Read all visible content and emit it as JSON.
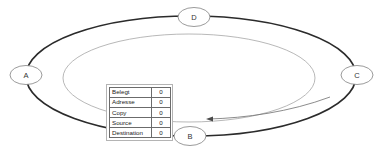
{
  "diagram": {
    "type": "ring-network-diagram",
    "background_color": "#ffffff",
    "outer_ring_color": "#2b2b2b",
    "inner_ring_color": "#9a9a9a",
    "node_stroke_color": "#808080",
    "arrow_color": "#6e6e6e",
    "nodes": [
      {
        "id": "A",
        "label": "A",
        "cx": 26,
        "cy": 75
      },
      {
        "id": "B",
        "label": "B",
        "cx": 190,
        "cy": 136
      },
      {
        "id": "C",
        "label": "C",
        "cx": 357,
        "cy": 75
      },
      {
        "id": "D",
        "label": "D",
        "cx": 194,
        "cy": 17
      }
    ],
    "rings": [
      {
        "name": "outer-ring",
        "cx": 191,
        "cy": 76,
        "rx": 165,
        "ry": 60
      },
      {
        "name": "inner-ring",
        "cx": 189,
        "cy": 78,
        "rx": 126,
        "ry": 44
      }
    ]
  },
  "table": {
    "title": "",
    "columns": [
      "field",
      "value"
    ],
    "rows": [
      {
        "field": "Belegt",
        "value": "0"
      },
      {
        "field": "Adresse",
        "value": "0"
      },
      {
        "field": "Copy",
        "value": "0"
      },
      {
        "field": "Source",
        "value": "0"
      },
      {
        "field": "Destination",
        "value": "0"
      }
    ]
  }
}
